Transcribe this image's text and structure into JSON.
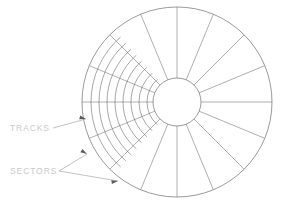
{
  "diagram": {
    "canvas": {
      "width": 282,
      "height": 208,
      "background": "#ffffff"
    },
    "colors": {
      "outline": "#6e6e73",
      "track_arc": "#5f5f64",
      "sector_line": "#6e6e73",
      "leader": "#9a9aa0",
      "label_text": "#c9c9cc",
      "arrow": "#5a5a5f"
    },
    "platter": {
      "center_x": 177,
      "center_y": 102,
      "outer_radius": 95,
      "hub_radius": 24
    },
    "sectors": {
      "count": 16,
      "angle_step_degrees": 22.5,
      "start_angle_degrees": 0
    },
    "tracks": {
      "count": 8,
      "fan_start_angle_degrees": 131,
      "fan_end_angle_degrees": 229,
      "radii": [
        30,
        38,
        46,
        54,
        62,
        70,
        78,
        86
      ]
    },
    "labels": [
      {
        "id": "tracks-label",
        "text": "TRACKS",
        "x": 10,
        "y": 131,
        "leaders": [
          {
            "x1": 53,
            "y1": 128,
            "x2": 86,
            "y2": 119,
            "arrow_x": 86,
            "arrow_y": 119,
            "arrow_angle": 345
          }
        ]
      },
      {
        "id": "sectors-label",
        "text": "SECTORS",
        "x": 10,
        "y": 174,
        "leaders": [
          {
            "x1": 59,
            "y1": 171,
            "x2": 87,
            "y2": 154,
            "arrow_x": 87,
            "arrow_y": 154,
            "arrow_angle": 329
          },
          {
            "x1": 59,
            "y1": 171,
            "x2": 118,
            "y2": 181,
            "arrow_x": 118,
            "arrow_y": 181,
            "arrow_angle": 10
          }
        ]
      }
    ]
  }
}
